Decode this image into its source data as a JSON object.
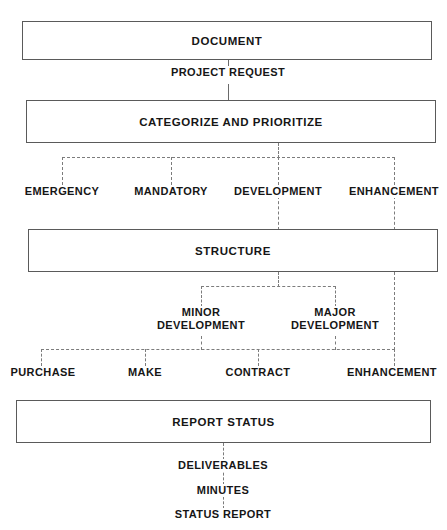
{
  "diagram": {
    "style": {
      "box_border_color": "#5a5a5a",
      "connector_color": "#7c7c7c",
      "text_color": "#161616",
      "background": "#ffffff"
    },
    "boxes": [
      {
        "id": "document",
        "label": "DOCUMENT",
        "x": 22,
        "y": 21,
        "w": 410,
        "h": 39
      },
      {
        "id": "categorize",
        "label": "CATEGORIZE AND PRIORITIZE",
        "x": 26,
        "y": 100,
        "w": 410,
        "h": 43
      },
      {
        "id": "structure",
        "label": "STRUCTURE",
        "x": 28,
        "y": 229,
        "w": 410,
        "h": 43
      },
      {
        "id": "report",
        "label": "REPORT STATUS",
        "x": 16,
        "y": 400,
        "w": 415,
        "h": 43
      }
    ],
    "edge_labels": [
      {
        "id": "project-request",
        "label": "PROJECT REQUEST",
        "x": 228,
        "y": 72
      }
    ],
    "category_row": {
      "items": [
        {
          "id": "emergency",
          "label": "EMERGENCY",
          "x": 62
        },
        {
          "id": "mandatory",
          "label": "MANDATORY",
          "x": 171
        },
        {
          "id": "development",
          "label": "DEVELOPMENT",
          "x": 278
        },
        {
          "id": "enhancement",
          "label": "ENHANCEMENT",
          "x": 394
        }
      ],
      "y": 189
    },
    "development_row": {
      "items": [
        {
          "id": "minor-development",
          "line1": "MINOR",
          "line2": "DEVELOPMENT",
          "x": 201
        },
        {
          "id": "major-development",
          "line1": "MAJOR",
          "line2": "DEVELOPMENT",
          "x": 335
        }
      ],
      "y": 311
    },
    "acquisition_row": {
      "items": [
        {
          "id": "purchase",
          "label": "PURCHASE",
          "x": 41
        },
        {
          "id": "make",
          "label": "MAKE",
          "x": 145
        },
        {
          "id": "contract",
          "label": "CONTRACT",
          "x": 258
        },
        {
          "id": "enhancement-leaf",
          "label": "ENHANCEMENT",
          "x": 394
        }
      ],
      "y": 369
    },
    "outputs": {
      "items": [
        {
          "id": "deliverables",
          "label": "DELIVERABLES",
          "x": 223,
          "y": 464
        },
        {
          "id": "minutes",
          "label": "MINUTES",
          "x": 223,
          "y": 489
        },
        {
          "id": "status-report",
          "label": "STATUS REPORT",
          "x": 223,
          "y": 513
        }
      ]
    }
  }
}
